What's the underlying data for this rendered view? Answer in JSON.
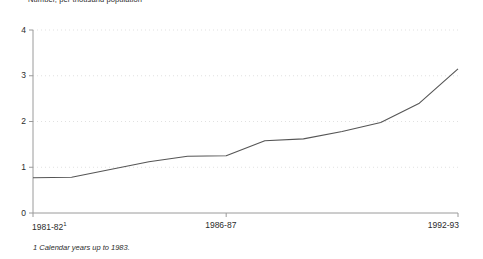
{
  "chart_data": {
    "type": "line",
    "title": "Number, per thousand population",
    "xlabel": "",
    "ylabel": "",
    "categories": [
      "1981-82",
      "1982-83",
      "1983-84",
      "1984-85",
      "1985-86",
      "1986-87",
      "1987-88",
      "1988-89",
      "1989-90",
      "1990-91",
      "1991-92",
      "1992-93"
    ],
    "values": [
      0.77,
      0.78,
      0.95,
      1.12,
      1.24,
      1.25,
      1.58,
      1.62,
      1.78,
      1.98,
      2.4,
      3.15
    ],
    "ylim": [
      0,
      4
    ],
    "yticks": [
      "0",
      "1",
      "2",
      "3",
      "4"
    ],
    "xticks": [
      "1981-82",
      "1986-87",
      "1992-93"
    ],
    "xtick_footnote_marker": "1",
    "grid": "dotted-horizontal",
    "legend": "none",
    "line_color": "#555555",
    "axis_color": "#9a9a9a",
    "grid_color": "#d9d9d9"
  },
  "footnote": {
    "marker": "1",
    "text": "Calendar years up to 1983."
  }
}
